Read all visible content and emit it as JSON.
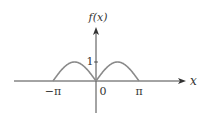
{
  "chart_data": {
    "type": "line",
    "title": "",
    "function": "|sin(x)|",
    "xlabel": "x",
    "ylabel": "f(x)",
    "xlim": [
      -3.14159,
      3.14159
    ],
    "ylim": [
      0,
      1
    ],
    "x_ticks": [
      {
        "value": -3.14159,
        "label": "−π"
      },
      {
        "value": 0,
        "label": "0"
      },
      {
        "value": 3.14159,
        "label": "π"
      }
    ],
    "y_ticks": [
      {
        "value": 1,
        "label": "1"
      }
    ],
    "series": [
      {
        "name": "f(x)",
        "domain": [
          -3.14159,
          3.14159
        ],
        "color": "#888888"
      }
    ],
    "grid": false,
    "legend": "none"
  },
  "colors": {
    "axis": "#333333",
    "curve": "#8a8a8a"
  }
}
